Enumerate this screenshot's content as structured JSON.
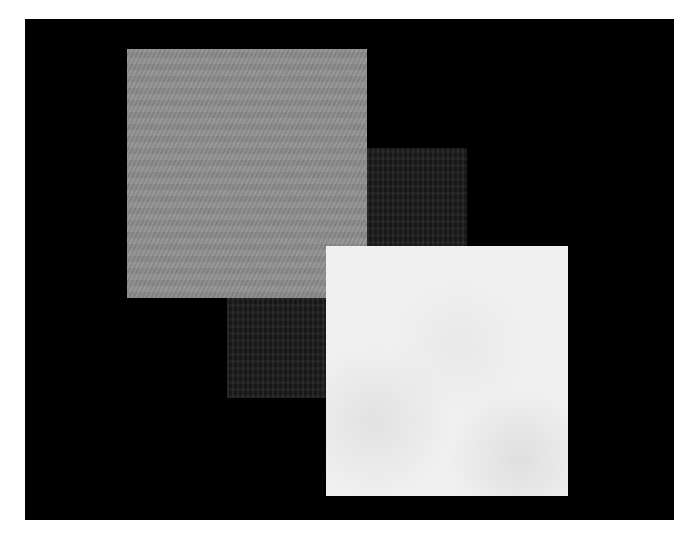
{
  "figure": {
    "background_color": "#000000",
    "page_color": "#ffffff",
    "squares": [
      {
        "id": "grey",
        "color": "#8e8e8e",
        "layer": 2
      },
      {
        "id": "dark",
        "color": "#1c1c1c",
        "layer": 1
      },
      {
        "id": "white",
        "color": "#f0f0f0",
        "layer": 3
      }
    ]
  }
}
